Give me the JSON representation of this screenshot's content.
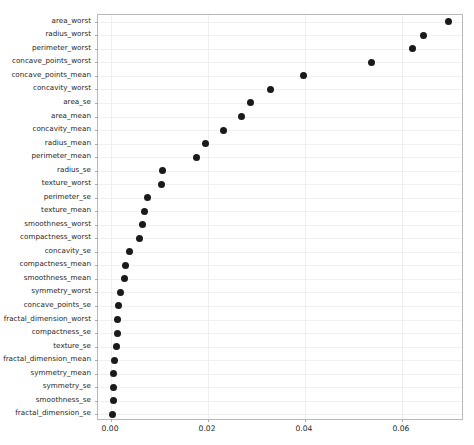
{
  "chart_data": {
    "type": "scatter",
    "title": "",
    "subtitle": "",
    "xlabel": "",
    "ylabel": "",
    "orientation": "horizontal-dot-plot",
    "grid": true,
    "legend": null,
    "xlim": [
      -0.0027,
      0.0728
    ],
    "xticks": [
      0.0,
      0.02,
      0.04,
      0.06
    ],
    "xticklabels": [
      "0.00",
      "0.02",
      "0.04",
      "0.06"
    ],
    "categories": [
      "area_worst",
      "radius_worst",
      "perimeter_worst",
      "concave_points_worst",
      "concave_points_mean",
      "concavity_worst",
      "area_se",
      "area_mean",
      "concavity_mean",
      "radius_mean",
      "perimeter_mean",
      "radius_se",
      "texture_worst",
      "perimeter_se",
      "texture_mean",
      "smoothness_worst",
      "compactness_worst",
      "concavity_se",
      "compactness_mean",
      "smoothness_mean",
      "symmetry_worst",
      "concave_points_se",
      "fractal_dimension_worst",
      "compactness_se",
      "texture_se",
      "fractal_dimension_mean",
      "symmetry_mean",
      "symmetry_se",
      "smoothness_se",
      "fractal_dimension_se"
    ],
    "values": [
      0.0695,
      0.0645,
      0.0621,
      0.0538,
      0.0396,
      0.0328,
      0.0287,
      0.0268,
      0.0231,
      0.0194,
      0.0177,
      0.0107,
      0.0103,
      0.0076,
      0.0068,
      0.0064,
      0.0058,
      0.0039,
      0.0029,
      0.0027,
      0.0019,
      0.0016,
      0.0014,
      0.0014,
      0.0012,
      0.0006,
      0.0005,
      0.0005,
      0.0004,
      0.0003
    ],
    "marker": {
      "shape": "circle",
      "color": "#1a1a1a",
      "size_px": 7
    },
    "colors": {
      "background": "#ffffff",
      "gridline": "#f0f0f2",
      "frame": "#b9b9bd",
      "text": "#262626"
    }
  }
}
